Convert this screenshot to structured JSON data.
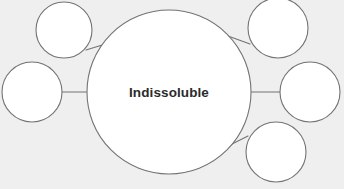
{
  "diagram": {
    "type": "bubble-map",
    "background_color": "#efefef",
    "node_fill_color": "#ffffff",
    "node_stroke_color": "#737373",
    "connector_color": "#737373",
    "label_color": "#2b2b2b",
    "center": {
      "label": "Indissoluble",
      "cx": 169,
      "cy": 92,
      "r": 82
    },
    "satellites": [
      {
        "name": "top-left",
        "label": "",
        "cx": 64,
        "cy": 30,
        "r": 28
      },
      {
        "name": "middle-left",
        "label": "",
        "cx": 32,
        "cy": 92,
        "r": 30
      },
      {
        "name": "top-right",
        "label": "",
        "cx": 278,
        "cy": 28,
        "r": 30
      },
      {
        "name": "middle-right",
        "label": "",
        "cx": 310,
        "cy": 92,
        "r": 30
      },
      {
        "name": "bottom-right",
        "label": "",
        "cx": 276,
        "cy": 152,
        "r": 30
      }
    ],
    "connectors": [
      {
        "name": "connector-top-left",
        "x1": 86,
        "y1": 50,
        "x2": 112,
        "y2": 42
      },
      {
        "name": "connector-middle-left",
        "x1": 62,
        "y1": 92,
        "x2": 88,
        "y2": 92
      },
      {
        "name": "connector-top-right",
        "x1": 250,
        "y1": 44,
        "x2": 228,
        "y2": 36
      },
      {
        "name": "connector-middle-right",
        "x1": 251,
        "y1": 92,
        "x2": 280,
        "y2": 92
      },
      {
        "name": "connector-bottom-right",
        "x1": 248,
        "y1": 136,
        "x2": 228,
        "y2": 146
      }
    ]
  }
}
